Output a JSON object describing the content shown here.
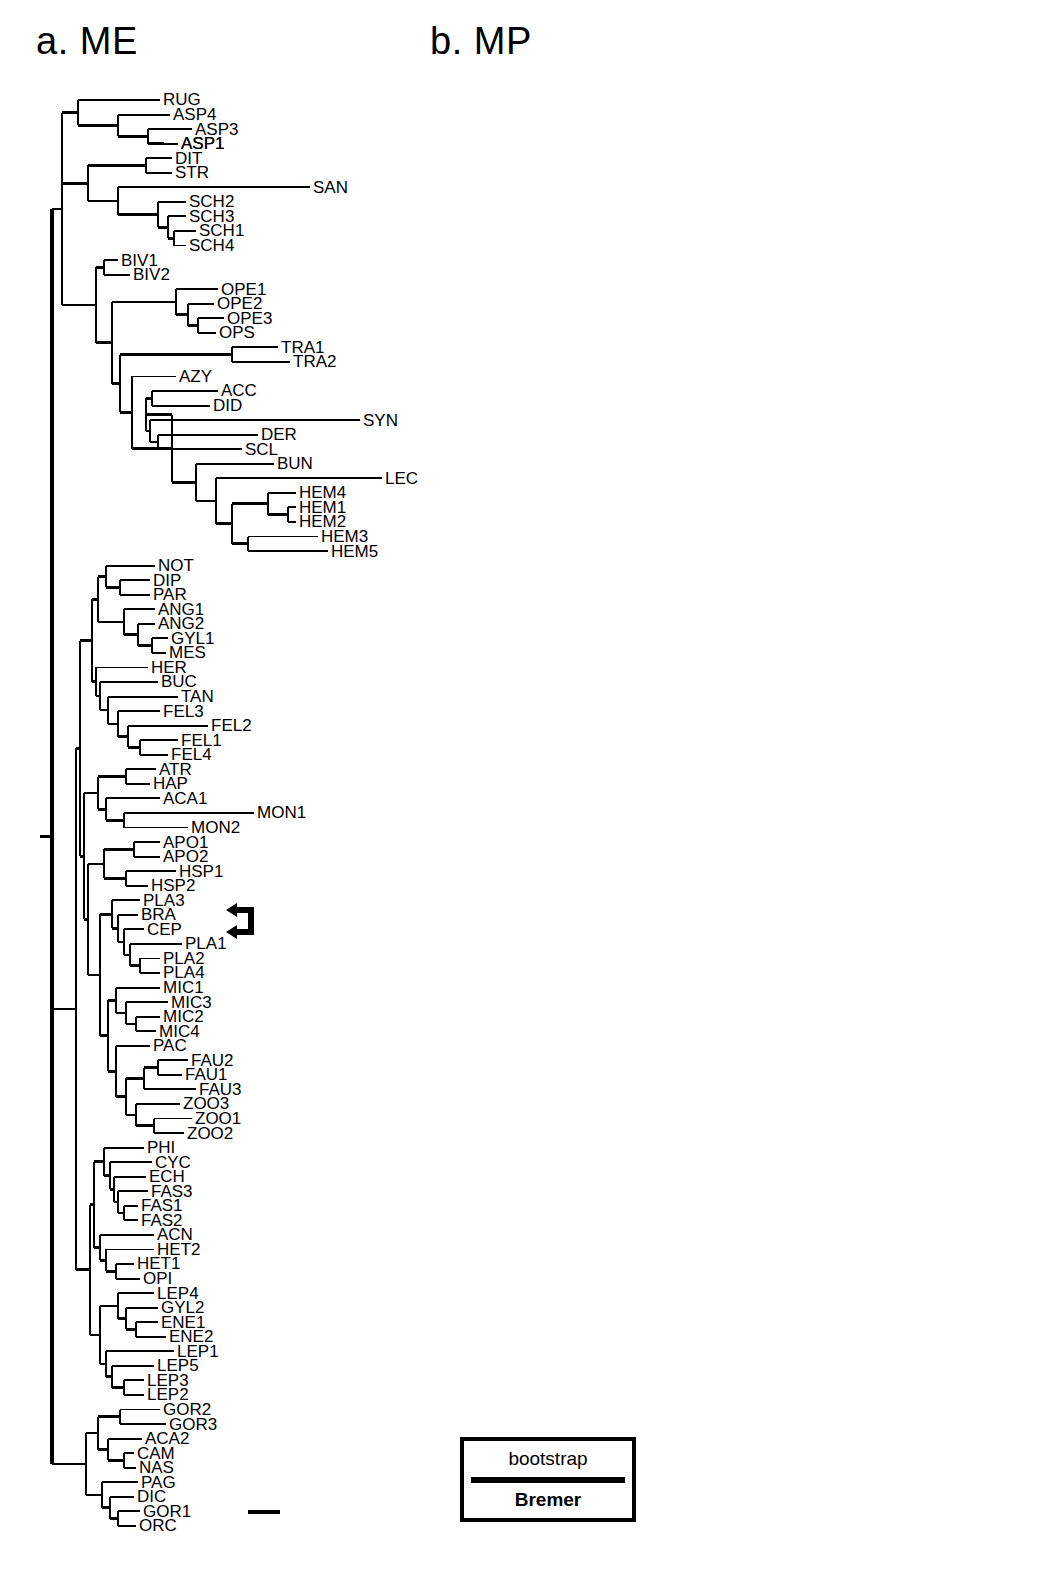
{
  "figure": {
    "panel_a_title": "a. ME",
    "panel_b_title": "b. MP",
    "legend": {
      "top_label": "bootstrap",
      "bottom_label": "Bremer"
    },
    "marker": {
      "name": "double-left-arrow",
      "points_at": [
        "CEP",
        "PLA1"
      ]
    },
    "scale_bar": {
      "label": ""
    }
  },
  "chart_data": {
    "type": "tree",
    "panels": [
      {
        "id": "a",
        "label": "a. ME",
        "method": "ME",
        "has_support_values": false,
        "has_scale_bar": true,
        "taxa": [
          "RUG",
          "ASP4",
          "ASP3",
          "ASP1",
          "DIT",
          "STR",
          "SAN",
          "SCH2",
          "SCH3",
          "SCH1",
          "SCH4",
          "BIV1",
          "BIV2",
          "OPE1",
          "OPE2",
          "OPE3",
          "OPS",
          "TRA1",
          "TRA2",
          "AZY",
          "ACC",
          "DID",
          "SYN",
          "DER",
          "SCL",
          "BUN",
          "LEC",
          "HEM4",
          "HEM1",
          "HEM2",
          "HEM3",
          "HEM5",
          "NOT",
          "DIP",
          "PAR",
          "ANG1",
          "ANG2",
          "GYL1",
          "MES",
          "HER",
          "BUC",
          "TAN",
          "FEL3",
          "FEL2",
          "FEL1",
          "FEL4",
          "ATR",
          "HAP",
          "ACA1",
          "MON1",
          "MON2",
          "APO1",
          "APO2",
          "HSP1",
          "HSP2",
          "PLA3",
          "BRA",
          "CEP",
          "PLA1",
          "PLA2",
          "PLA4",
          "MIC1",
          "MIC3",
          "MIC2",
          "MIC4",
          "PAC",
          "FAU2",
          "FAU1",
          "FAU3",
          "ZOO3",
          "ZOO1",
          "ZOO2",
          "PHI",
          "CYC",
          "ECH",
          "FAS3",
          "FAS1",
          "FAS2",
          "ACN",
          "HET2",
          "HET1",
          "OPI",
          "LEP4",
          "GYL2",
          "ENE1",
          "ENE2",
          "LEP1",
          "LEP5",
          "LEP3",
          "LEP2",
          "GOR2",
          "GOR3",
          "ACA2",
          "CAM",
          "NAS",
          "PAG",
          "DIC",
          "GOR1",
          "ORC"
        ]
      },
      {
        "id": "b",
        "label": "b. MP",
        "method": "MP",
        "has_support_values": true,
        "support_types": [
          "bootstrap",
          "Bremer"
        ],
        "taxa": [
          "RUG",
          "ASP4",
          "ASP3",
          "ASP1",
          "ASP2",
          "DIT",
          "STR",
          "SAN",
          "SCH2",
          "SCH3",
          "SCH1",
          "SCH4",
          "BIV1",
          "BIV2",
          "BUC",
          "TRA1",
          "TRA2",
          "OPE1",
          "OPE2",
          "OPE3",
          "OPS",
          "DIP",
          "PAR",
          "ANG1",
          "ANG2",
          "GYL1",
          "MES",
          "HER",
          "TAN",
          "FEL3",
          "FEL2",
          "FEL1",
          "FEL4",
          "NOT",
          "AZY",
          "SCL",
          "ACC",
          "SYN",
          "DER",
          "DID",
          "BUN",
          "HEM4",
          "LEC",
          "HEM5",
          "HEM2",
          "HEM1",
          "HEM3",
          "CYC",
          "PHI",
          "ECH",
          "FAS3",
          "FAS1",
          "FAS2",
          "HSP1",
          "HSP2",
          "ACN",
          "HET2",
          "HET1",
          "OPI",
          "LEP3",
          "LEP2",
          "LEP1",
          "LEP5",
          "LEP4",
          "GYL2",
          "ENE1",
          "ENE2",
          "ACA2",
          "CAM",
          "NAS",
          "GOR2",
          "GOR3",
          "DIC",
          "GOR1",
          "ORC",
          "PAG",
          "ATR",
          "HAP",
          "APO1",
          "APO2",
          "ACA1",
          "MON1",
          "MON2",
          "PLA3",
          "BRA",
          "CEP",
          "PLA1",
          "PLA2",
          "PLA4",
          "PAC",
          "MIC1",
          "MIC3",
          "MIC2",
          "MIC4",
          "ZOO1",
          "ZOO2",
          "ZOO3",
          "FAU1",
          "FAU2",
          "FAU3"
        ],
        "node_support": [
          {
            "bootstrap": "100",
            "bremer": "21"
          },
          {
            "bootstrap": "100",
            "bremer": "21"
          },
          {
            "bootstrap": "98",
            "bremer": "11"
          },
          {
            "bootstrap": "99",
            "bremer": "12"
          },
          {
            "bootstrap": "100",
            "bremer": "12"
          },
          {
            "bootstrap": "72",
            "bremer": "5"
          },
          {
            "bootstrap": "100",
            "bremer": "32"
          },
          {
            "bootstrap": "90",
            "bremer": "19"
          },
          {
            "bootstrap": "100",
            "bremer": "21"
          },
          {
            "bootstrap": "95",
            "bremer": "6"
          },
          {
            "bootstrap": "85",
            "bremer": "2"
          },
          {
            "bootstrap": "100",
            "bremer": "20"
          },
          {
            "bootstrap": "",
            "bremer": "4"
          },
          {
            "bootstrap": "100",
            "bremer": "78"
          },
          {
            "bootstrap": "100",
            "bremer": "69"
          },
          {
            "bootstrap": "",
            "bremer": "95"
          },
          {
            "bootstrap": "50",
            "bremer": "5"
          },
          {
            "bootstrap": "85",
            "bremer": "3"
          },
          {
            "bootstrap": "99",
            "bremer": "15"
          },
          {
            "bootstrap": "97",
            "bremer": "8"
          },
          {
            "bootstrap": "100",
            "bremer": "17"
          },
          {
            "bootstrap": "",
            "bremer": "1"
          },
          {
            "bootstrap": "76",
            "bremer": "6"
          },
          {
            "bootstrap": "74",
            "bremer": "5"
          },
          {
            "bootstrap": "98",
            "bremer": "7"
          },
          {
            "bootstrap": "",
            "bremer": "3"
          },
          {
            "bootstrap": "63",
            "bremer": "12"
          },
          {
            "bootstrap": "95",
            "bremer": "18"
          },
          {
            "bootstrap": "72",
            "bremer": "8"
          },
          {
            "bootstrap": "",
            "bremer": "3"
          },
          {
            "bootstrap": "",
            "bremer": "2"
          },
          {
            "bootstrap": "98",
            "bremer": "17"
          },
          {
            "bootstrap": "100",
            "bremer": "17"
          },
          {
            "bootstrap": "",
            "bremer": "1"
          },
          {
            "bootstrap": "88",
            "bremer": "8"
          },
          {
            "bootstrap": "",
            "bremer": "1"
          },
          {
            "bootstrap": "100",
            "bremer": "18"
          },
          {
            "bootstrap": "100",
            "bremer": "15"
          },
          {
            "bootstrap": "",
            "bremer": "1"
          },
          {
            "bootstrap": "",
            "bremer": "1"
          },
          {
            "bootstrap": "71",
            "bremer": "2"
          },
          {
            "bootstrap": "94",
            "bremer": "3"
          },
          {
            "bootstrap": "100",
            "bremer": "6"
          },
          {
            "bootstrap": "86",
            "bremer": "2"
          },
          {
            "bootstrap": "67",
            "bremer": "2"
          },
          {
            "bootstrap": "93",
            "bremer": "5"
          },
          {
            "bootstrap": "",
            "bremer": "1"
          },
          {
            "bootstrap": "96",
            "bremer": "11"
          },
          {
            "bootstrap": "94",
            "bremer": "4"
          },
          {
            "bootstrap": "",
            "bremer": "1"
          },
          {
            "bootstrap": "50",
            "bremer": "3"
          },
          {
            "bootstrap": "",
            "bremer": "1"
          },
          {
            "bootstrap": "",
            "bremer": "3"
          },
          {
            "bootstrap": "100",
            "bremer": "12"
          },
          {
            "bootstrap": "",
            "bremer": "1"
          },
          {
            "bootstrap": "62",
            "bremer": "1"
          },
          {
            "bootstrap": "99",
            "bremer": "5"
          },
          {
            "bootstrap": "85",
            "bremer": ""
          },
          {
            "bootstrap": "",
            "bremer": "1"
          },
          {
            "bootstrap": "",
            "bremer": "1"
          },
          {
            "bootstrap": "100",
            "bremer": "23"
          },
          {
            "bootstrap": "",
            "bremer": "1"
          },
          {
            "bootstrap": "100",
            "bremer": "27"
          },
          {
            "bootstrap": "85",
            "bremer": "9"
          },
          {
            "bootstrap": "92",
            "bremer": "18"
          },
          {
            "bootstrap": "",
            "bremer": "2"
          },
          {
            "bootstrap": "74",
            "bremer": "4"
          },
          {
            "bootstrap": "56",
            "bremer": "1"
          },
          {
            "bootstrap": "75",
            "bremer": "5"
          },
          {
            "bootstrap": "100",
            "bremer": "17"
          },
          {
            "bootstrap": "",
            "bremer": "2"
          },
          {
            "bootstrap": "61",
            "bremer": "1"
          },
          {
            "bootstrap": "100",
            "bremer": "12"
          },
          {
            "bootstrap": "88",
            "bremer": "6"
          },
          {
            "bootstrap": "90",
            "bremer": "5"
          },
          {
            "bootstrap": "60",
            "bremer": "3"
          },
          {
            "bootstrap": "100",
            "bremer": "21"
          },
          {
            "bootstrap": "58",
            "bremer": "2"
          }
        ]
      }
    ]
  }
}
